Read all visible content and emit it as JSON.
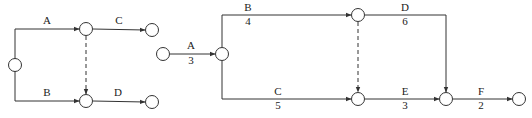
{
  "diagrams": [
    {
      "id": "left",
      "nodes": [
        {
          "id": "n1",
          "x": 15,
          "y": 65
        },
        {
          "id": "n2",
          "x": 86,
          "y": 29
        },
        {
          "id": "n3",
          "x": 152,
          "y": 30
        },
        {
          "id": "n4",
          "x": 86,
          "y": 101
        },
        {
          "id": "n5",
          "x": 152,
          "y": 102
        }
      ],
      "edges": [
        {
          "id": "A",
          "label": "A",
          "duration": "",
          "points": [
            [
              15,
              59
            ],
            [
              15,
              29
            ],
            [
              79,
              29
            ]
          ],
          "label_x": 47,
          "label_y": 24,
          "dashed": false
        },
        {
          "id": "B",
          "label": "B",
          "duration": "",
          "points": [
            [
              15,
              71
            ],
            [
              15,
              101
            ],
            [
              79,
              101
            ]
          ],
          "label_x": 47,
          "label_y": 96,
          "dashed": false
        },
        {
          "id": "C",
          "label": "C",
          "duration": "",
          "points": [
            [
              93,
              29
            ],
            [
              145,
              30
            ]
          ],
          "label_x": 119,
          "label_y": 24,
          "dashed": false
        },
        {
          "id": "D",
          "label": "D",
          "duration": "",
          "points": [
            [
              93,
              101
            ],
            [
              145,
              102
            ]
          ],
          "label_x": 118,
          "label_y": 96,
          "dashed": false
        },
        {
          "id": "dummy",
          "label": "",
          "duration": "",
          "points": [
            [
              86,
              36
            ],
            [
              86,
              94
            ]
          ],
          "dashed": true
        }
      ]
    },
    {
      "id": "right",
      "nodes": [
        {
          "id": "m1",
          "x": 163,
          "y": 54
        },
        {
          "id": "m2",
          "x": 222,
          "y": 54
        },
        {
          "id": "m3",
          "x": 358,
          "y": 15
        },
        {
          "id": "m4",
          "x": 358,
          "y": 99
        },
        {
          "id": "m5",
          "x": 446,
          "y": 99
        },
        {
          "id": "m6",
          "x": 519,
          "y": 99
        }
      ],
      "edges": [
        {
          "id": "A",
          "label": "A",
          "duration": "3",
          "points": [
            [
              170,
              54
            ],
            [
              215,
              54
            ]
          ],
          "label_x": 191,
          "label_y": 49,
          "duration_y": 64,
          "dashed": false
        },
        {
          "id": "B",
          "label": "B",
          "duration": "4",
          "points": [
            [
              222,
              47
            ],
            [
              222,
              15
            ],
            [
              351,
              15
            ]
          ],
          "label_x": 248,
          "label_y": 11,
          "duration_y": 25,
          "dashed": false
        },
        {
          "id": "C",
          "label": "C",
          "duration": "5",
          "points": [
            [
              222,
              61
            ],
            [
              222,
              99
            ],
            [
              351,
              99
            ]
          ],
          "label_x": 278,
          "label_y": 95,
          "duration_y": 109,
          "dashed": false
        },
        {
          "id": "D",
          "label": "D",
          "duration": "6",
          "points": [
            [
              365,
              15
            ],
            [
              446,
              15
            ],
            [
              446,
              92
            ]
          ],
          "label_x": 405,
          "label_y": 11,
          "duration_y": 25,
          "dashed": false
        },
        {
          "id": "E",
          "label": "E",
          "duration": "3",
          "points": [
            [
              365,
              99
            ],
            [
              439,
              99
            ]
          ],
          "label_x": 405,
          "label_y": 95,
          "duration_y": 109,
          "dashed": false
        },
        {
          "id": "F",
          "label": "F",
          "duration": "2",
          "points": [
            [
              453,
              99
            ],
            [
              512,
              99
            ]
          ],
          "label_x": 481,
          "label_y": 95,
          "duration_y": 109,
          "dashed": false
        },
        {
          "id": "dummy",
          "label": "",
          "duration": "",
          "points": [
            [
              358,
              22
            ],
            [
              358,
              92
            ]
          ],
          "dashed": true
        }
      ]
    }
  ],
  "style": {
    "line_color": "#333333",
    "text_color": "#222222",
    "node_radius": 6.5
  }
}
